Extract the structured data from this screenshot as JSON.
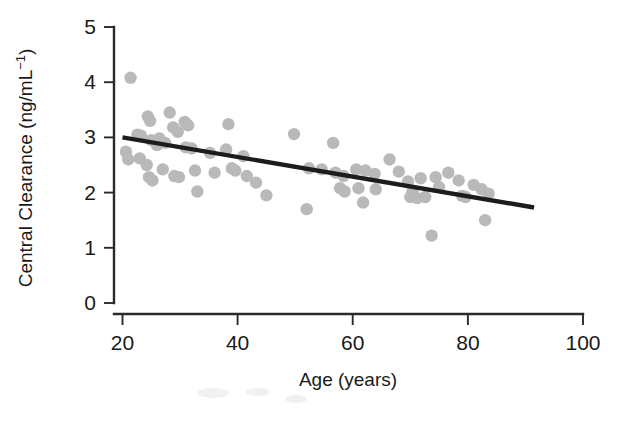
{
  "chart_data": {
    "type": "scatter",
    "title": "",
    "xlabel": "Age (years)",
    "ylabel": "Central Clearance (ng/mL⁻¹)",
    "ylabel_base": "Central Clearance (ng/mL",
    "ylabel_exponent": "−1",
    "ylabel_tail": ")",
    "xlim": [
      14,
      100
    ],
    "ylim": [
      0,
      5
    ],
    "xticks": [
      20,
      40,
      60,
      80,
      100
    ],
    "xtick_labels": [
      "20",
      "40",
      "60",
      "80",
      "100"
    ],
    "yticks": [
      0,
      1,
      2,
      3,
      4,
      5
    ],
    "ytick_labels": [
      "0",
      "1",
      "2",
      "3",
      "4",
      "5"
    ],
    "grid": false,
    "legend": null,
    "point_color": "#b9b9b9",
    "line_color": "#1c1c1c",
    "axis_color": "#2a2a2a",
    "series": [
      {
        "name": "subjects",
        "marker": "filled-circle",
        "points": [
          [
            21.4,
            4.08
          ],
          [
            20.6,
            2.74
          ],
          [
            21.0,
            2.6
          ],
          [
            22.6,
            3.05
          ],
          [
            23.2,
            3.03
          ],
          [
            23.0,
            2.62
          ],
          [
            24.4,
            3.38
          ],
          [
            24.8,
            3.3
          ],
          [
            25.0,
            2.95
          ],
          [
            24.2,
            2.5
          ],
          [
            24.6,
            2.28
          ],
          [
            25.2,
            2.22
          ],
          [
            26.4,
            2.98
          ],
          [
            26.0,
            2.86
          ],
          [
            27.4,
            2.9
          ],
          [
            27.0,
            2.42
          ],
          [
            28.2,
            3.45
          ],
          [
            28.8,
            3.18
          ],
          [
            29.6,
            3.1
          ],
          [
            29.0,
            2.3
          ],
          [
            29.8,
            2.28
          ],
          [
            30.8,
            3.28
          ],
          [
            31.4,
            3.22
          ],
          [
            31.0,
            2.82
          ],
          [
            32.0,
            2.8
          ],
          [
            32.6,
            2.4
          ],
          [
            33.0,
            2.02
          ],
          [
            35.2,
            2.72
          ],
          [
            36.0,
            2.36
          ],
          [
            38.4,
            3.24
          ],
          [
            38.0,
            2.78
          ],
          [
            39.0,
            2.44
          ],
          [
            39.6,
            2.4
          ],
          [
            41.0,
            2.66
          ],
          [
            41.6,
            2.3
          ],
          [
            43.2,
            2.18
          ],
          [
            45.0,
            1.95
          ],
          [
            49.8,
            3.06
          ],
          [
            52.4,
            2.44
          ],
          [
            52.0,
            1.7
          ],
          [
            54.6,
            2.42
          ],
          [
            56.6,
            2.9
          ],
          [
            57.0,
            2.36
          ],
          [
            58.4,
            2.3
          ],
          [
            57.8,
            2.08
          ],
          [
            58.6,
            2.02
          ],
          [
            60.6,
            2.42
          ],
          [
            61.0,
            2.08
          ],
          [
            61.8,
            1.82
          ],
          [
            62.2,
            2.4
          ],
          [
            63.8,
            2.34
          ],
          [
            64.0,
            2.06
          ],
          [
            66.4,
            2.6
          ],
          [
            68.0,
            2.38
          ],
          [
            69.6,
            2.2
          ],
          [
            70.4,
            2.02
          ],
          [
            70.0,
            1.92
          ],
          [
            71.2,
            1.9
          ],
          [
            71.8,
            2.26
          ],
          [
            72.6,
            1.92
          ],
          [
            73.7,
            1.22
          ],
          [
            74.4,
            2.28
          ],
          [
            75.0,
            2.1
          ],
          [
            76.6,
            2.36
          ],
          [
            78.4,
            2.22
          ],
          [
            79.0,
            1.94
          ],
          [
            79.6,
            1.92
          ],
          [
            81.0,
            2.14
          ],
          [
            82.4,
            2.06
          ],
          [
            83.0,
            1.5
          ],
          [
            83.6,
            1.98
          ]
        ]
      }
    ],
    "fit_line": {
      "name": "linear-regression",
      "x_start": 20.0,
      "y_start": 3.0,
      "x_end": 91.5,
      "y_end": 1.73
    }
  }
}
